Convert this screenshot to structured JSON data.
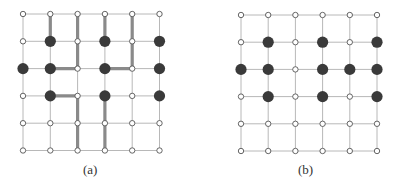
{
  "panels": [
    {
      "label": "(a)",
      "origin_x": 23,
      "origin_y": 14,
      "spacing": 27.3,
      "rows": 6,
      "cols": 6,
      "filled": [
        [
          1,
          1
        ],
        [
          1,
          3
        ],
        [
          1,
          5
        ],
        [
          2,
          0
        ],
        [
          2,
          1
        ],
        [
          2,
          3
        ],
        [
          2,
          5
        ],
        [
          3,
          1
        ],
        [
          3,
          3
        ],
        [
          3,
          5
        ]
      ],
      "paths": [
        [
          [
            0,
            1
          ],
          [
            1,
            1
          ]
        ],
        [
          [
            0,
            2
          ],
          [
            2,
            2
          ],
          [
            2,
            1
          ]
        ],
        [
          [
            0,
            3
          ],
          [
            1,
            3
          ]
        ],
        [
          [
            0,
            4
          ],
          [
            2,
            4
          ],
          [
            2,
            3
          ]
        ],
        [
          [
            3,
            1
          ],
          [
            3,
            2
          ],
          [
            5,
            2
          ]
        ],
        [
          [
            3,
            3
          ],
          [
            5,
            3
          ]
        ]
      ]
    },
    {
      "label": "(b)",
      "origin_x": 241,
      "origin_y": 15,
      "spacing": 27.2,
      "rows": 6,
      "cols": 6,
      "filled": [
        [
          1,
          1
        ],
        [
          1,
          3
        ],
        [
          1,
          5
        ],
        [
          2,
          0
        ],
        [
          2,
          1
        ],
        [
          2,
          3
        ],
        [
          2,
          4
        ],
        [
          2,
          5
        ],
        [
          3,
          1
        ],
        [
          3,
          3
        ],
        [
          3,
          5
        ]
      ],
      "paths": []
    }
  ],
  "colors": {
    "grid_line": "#b8b8b8",
    "path": "#8a8a8a",
    "filled_node": "#3a3a3a",
    "open_node_stroke": "#555555",
    "open_node_fill": "#ffffff"
  }
}
